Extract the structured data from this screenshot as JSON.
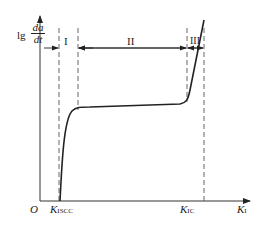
{
  "diagram": {
    "y_axis_label": {
      "prefix": "lg",
      "num": "da",
      "den": "dt"
    },
    "x_axis_label": {
      "main": "K",
      "sub": "I"
    },
    "origin": "O",
    "ticks": [
      {
        "main": "K",
        "sub": "ISCC"
      },
      {
        "main": "K",
        "sub": "IC"
      }
    ],
    "regions": [
      "I",
      "II",
      "III"
    ]
  }
}
